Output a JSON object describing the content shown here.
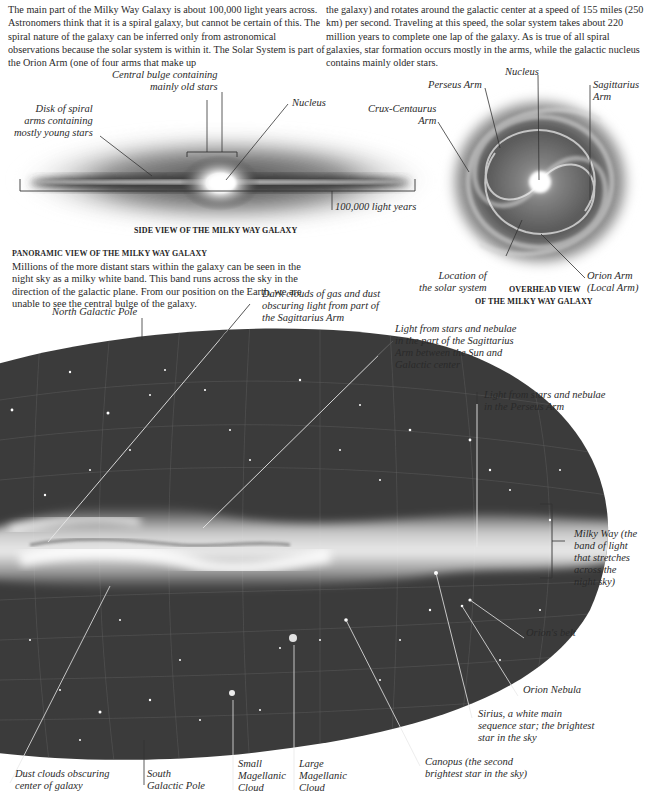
{
  "intro": {
    "left": "The main part of the Milky Way Galaxy is about 100,000 light years across. Astronomers think that it is a spiral galaxy, but cannot be certain of this. The spiral nature of the galaxy can be inferred only from astronomical observations because the solar system is within it. The Solar System is part of the Orion Arm (one of four arms that make up",
    "right": "the galaxy) and rotates around the galactic center at a speed of 155 miles (250 km) per second. Traveling at this speed, the solar system takes about 220 million years to complete one lap of the galaxy. As is true of all spiral galaxies, star formation occurs mostly in the arms, while the galactic nucleus contains mainly older stars."
  },
  "side_view": {
    "caption": "SIDE VIEW OF THE MILKY WAY GALAXY",
    "labels": {
      "bulge_1": "Central bulge containing",
      "bulge_2": "mainly old stars",
      "disk_1": "Disk of spiral",
      "disk_2": "arms containing",
      "disk_3": "mostly young stars",
      "nucleus": "Nucleus",
      "scale": "100,000 light years"
    }
  },
  "overhead_view": {
    "caption_1": "OVERHEAD VIEW",
    "caption_2": "OF THE MILKY WAY GALAXY",
    "labels": {
      "nucleus": "Nucleus",
      "perseus": "Perseus Arm",
      "sagittarius_1": "Sagittarius",
      "sagittarius_2": "Arm",
      "crux_1": "Crux-Centaurus",
      "crux_2": "Arm",
      "location_1": "Location of",
      "location_2": "the solar system",
      "orion_1": "Orion Arm",
      "orion_2": "(Local Arm)"
    }
  },
  "panorama": {
    "heading": "PANORAMIC VIEW OF THE MILKY WAY GALAXY",
    "body": "Millions of the more distant stars within the galaxy can be seen in the night sky as a milky white band. This band runs across the sky in the direction of the galactic plane. From our position on the Earth, we are unable to see the central bulge of the galaxy.",
    "labels": {
      "north_pole": "North Galactic Pole",
      "dark_clouds_1": "Dark clouds of gas and dust",
      "dark_clouds_2": "obscuring light from part of",
      "dark_clouds_3": "the Sagittarius Arm",
      "sag_light_1": "Light from stars and nebulae",
      "sag_light_2": "in the part of the Sagittarius",
      "sag_light_3": "Arm between the Sun and",
      "sag_light_4": "Galactic center",
      "perseus_light_1": "Light from stars and nebulae",
      "perseus_light_2": "in the Perseus Arm",
      "milky_way_1": "Milky Way (the",
      "milky_way_2": "band of light",
      "milky_way_3": "that stretches",
      "milky_way_4": "across the",
      "milky_way_5": "night sky)",
      "orions_belt": "Orion's belt",
      "orion_nebula": "Orion Nebula",
      "sirius_1": "Sirius, a white main",
      "sirius_2": "sequence star; the brightest",
      "sirius_3": "star in the sky",
      "canopus_1": "Canopus (the second",
      "canopus_2": "brightest star in the sky)",
      "dust_1": "Dust clouds obscuring",
      "dust_2": "center of galaxy",
      "south_pole_1": "South",
      "south_pole_2": "Galactic Pole",
      "smc_1": "Small",
      "smc_2": "Magellanic",
      "smc_3": "Cloud",
      "lmc_1": "Large",
      "lmc_2": "Magellanic",
      "lmc_3": "Cloud"
    }
  }
}
